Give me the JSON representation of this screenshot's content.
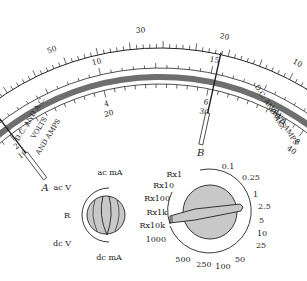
{
  "meter": {
    "ohms_label": "OHMS",
    "ohms_ticks": [
      "INF",
      "5k",
      "500",
      "100",
      "50",
      "30",
      "20",
      "10",
      "5",
      "0"
    ],
    "volts_label_lines": [
      "D.C. AND A.C.",
      "VOLTS",
      "AND AMPS"
    ],
    "scale_10": [
      "0",
      "5",
      "10",
      "15",
      "20",
      "25"
    ],
    "scale_10_inner": [
      "0",
      "2",
      "4",
      "6",
      "8",
      "10"
    ],
    "scale_50": [
      "0",
      "10",
      "20",
      "30",
      "40",
      "50"
    ],
    "needles": [
      {
        "label": "A",
        "fraction": 0.2
      },
      {
        "label": "B",
        "fraction": 0.6
      },
      {
        "label": "C",
        "fraction": 0.985
      }
    ]
  },
  "function_switch": {
    "options": [
      "ac mA",
      "ac V",
      "R",
      "dc V",
      "dc mA"
    ]
  },
  "range_switch": {
    "ohm_ranges": [
      "Rx1",
      "Rx10",
      "Rx100",
      "Rx1k",
      "Rx10k"
    ],
    "other_ranges": [
      "1000",
      "500",
      "250",
      "100",
      "50",
      "25",
      "10",
      "5",
      "2.5",
      "1",
      "0.25",
      "0.1"
    ],
    "selected": "Rx1k"
  },
  "colors": {
    "band": "#6e6e6e",
    "knob": "#c8c8c8",
    "ink": "#222222"
  }
}
